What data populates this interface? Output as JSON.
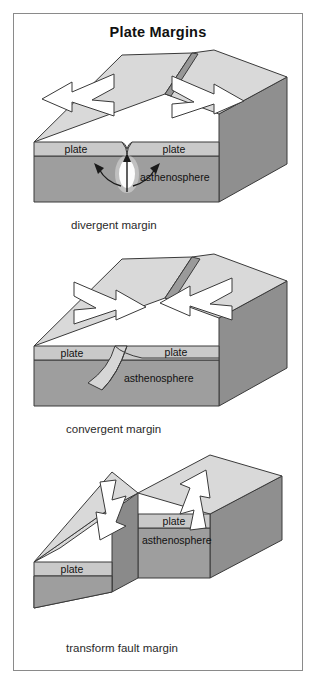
{
  "title": "Plate Margins",
  "colors": {
    "frame_border": "#8a8a8a",
    "page_background": "#ffffff",
    "top_surface": "#d6d6d6",
    "top_surface_light": "#dedede",
    "front_plate_band": "#c4c4c4",
    "front_asthenosphere": "#9e9e9e",
    "side_face": "#8f8f8f",
    "rift_face": "#9a9a9a",
    "slab_fill": "#d0d0d0",
    "arrow_fill": "#ffffff",
    "outline": "#3a3a3a",
    "text": "#1a1a1a",
    "vent_glow": "#ffffff"
  },
  "panels": [
    {
      "id": "divergent",
      "caption": "divergent margin",
      "layer_labels": {
        "left_plate": "plate",
        "right_plate": "plate",
        "asthenosphere": "asthenosphere"
      },
      "arrows": [
        {
          "name": "left-plate-motion-arrow",
          "direction": "left"
        },
        {
          "name": "right-plate-motion-arrow",
          "direction": "right"
        }
      ],
      "features": [
        {
          "name": "rift-valley",
          "type": "rift"
        },
        {
          "name": "magma-upwelling-arrow",
          "type": "arrow-up"
        },
        {
          "name": "spreading-arrow-left",
          "type": "curved-arrow-left"
        },
        {
          "name": "spreading-arrow-right",
          "type": "curved-arrow-right"
        }
      ]
    },
    {
      "id": "convergent",
      "caption": "convergent margin",
      "layer_labels": {
        "left_plate": "plate",
        "right_plate": "plate",
        "asthenosphere": "asthenosphere"
      },
      "arrows": [
        {
          "name": "left-plate-motion-arrow",
          "direction": "right"
        },
        {
          "name": "right-plate-motion-arrow",
          "direction": "left"
        }
      ],
      "features": [
        {
          "name": "subducting-slab",
          "type": "slab"
        }
      ]
    },
    {
      "id": "transform",
      "caption": "transform fault margin",
      "layer_labels": {
        "left_plate": "plate",
        "right_plate": "plate",
        "asthenosphere": "asthenosphere"
      },
      "arrows": [
        {
          "name": "left-plate-motion-arrow",
          "direction": "down-left"
        },
        {
          "name": "right-plate-motion-arrow",
          "direction": "up-right"
        }
      ],
      "features": [
        {
          "name": "transform-fault-offset",
          "type": "offset-step"
        }
      ]
    }
  ]
}
